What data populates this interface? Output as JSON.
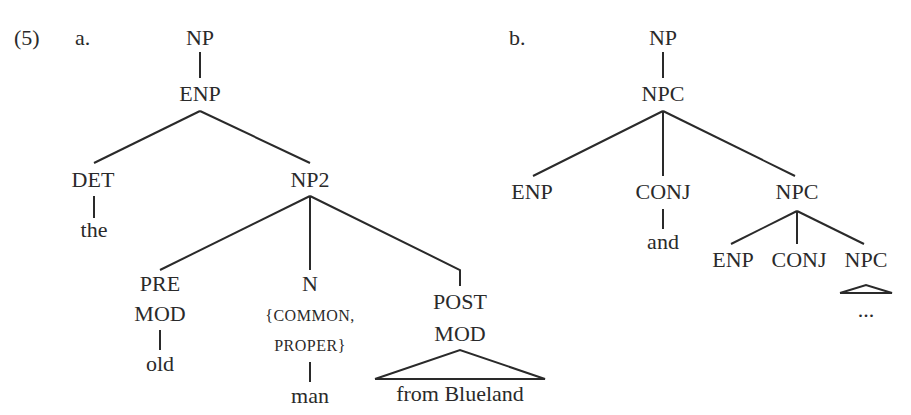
{
  "example": {
    "number": "(5)",
    "trees": [
      {
        "label": "a.",
        "root": "NP",
        "l1": "ENP",
        "l2": {
          "det": "DET",
          "np2": "NP2"
        },
        "det_word": "the",
        "l3": {
          "premod_1": "PRE",
          "premod_2": "MOD",
          "n": "N",
          "n_feat_1": "{COMMON,",
          "n_feat_2": "PROPER}",
          "postmod_1": "POST",
          "postmod_2": "MOD"
        },
        "words": {
          "premod": "old",
          "n": "man",
          "postmod": "from Blueland"
        }
      },
      {
        "label": "b.",
        "root": "NP",
        "l1": "NPC",
        "l2": {
          "enp": "ENP",
          "conj": "CONJ",
          "npc": "NPC"
        },
        "conj_word": "and",
        "l3": {
          "enp": "ENP",
          "conj": "CONJ",
          "npc": "NPC"
        },
        "ellipsis": "..."
      }
    ]
  }
}
